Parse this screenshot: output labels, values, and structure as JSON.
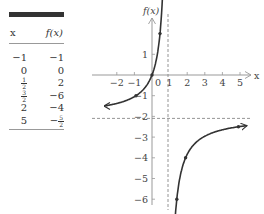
{
  "table": {
    "headers": {
      "x": "x",
      "fx": "f(x)"
    },
    "rows": [
      {
        "x": "−1",
        "fx": "−1"
      },
      {
        "x": "0",
        "fx": "0"
      },
      {
        "x": {
          "num": "1",
          "den": "2"
        },
        "fx": "2"
      },
      {
        "x": {
          "num": "3",
          "den": "2"
        },
        "fx": "−6"
      },
      {
        "x": "2",
        "fx": "−4"
      },
      {
        "x": "5",
        "fx": {
          "sign": "−",
          "num": "5",
          "den": "2"
        }
      }
    ]
  },
  "chart_data": {
    "type": "line",
    "title": "",
    "xlabel": "x",
    "ylabel": "f(x)",
    "xlim": [
      -3,
      6
    ],
    "ylim": [
      -6.5,
      2.5
    ],
    "xticks": [
      -2,
      -1,
      0,
      1,
      2,
      3,
      4,
      5
    ],
    "yticks": [
      1,
      -1,
      -2,
      -3,
      -4,
      -5,
      -6
    ],
    "grid": false,
    "function": "f(x) = 2x/(1-x)",
    "asymptotes": {
      "vertical": 1,
      "horizontal": -2
    },
    "points": [
      {
        "x": -1,
        "y": -1
      },
      {
        "x": 0,
        "y": 0
      },
      {
        "x": 0.5,
        "y": 2
      },
      {
        "x": 1.5,
        "y": -6
      },
      {
        "x": 2,
        "y": -4
      },
      {
        "x": 5,
        "y": -2.5
      }
    ],
    "colors": {
      "curve": "#333333",
      "axes": "#999999",
      "asymptote": "#888888"
    }
  }
}
